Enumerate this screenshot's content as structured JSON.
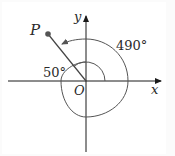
{
  "diagram": {
    "type": "angle-in-standard-position",
    "labels": {
      "point": "P",
      "y_axis": "y",
      "x_axis": "x",
      "origin": "O",
      "angle_large": "490°",
      "angle_small": "50°"
    },
    "angles": {
      "rotation_degrees": 490,
      "reference_angle_to_negative_x_degrees": 50,
      "terminal_side_degrees": 130
    },
    "colors": {
      "line": "#2a2a2a",
      "arc": "#555555",
      "point": "#555555",
      "border": "#eeeeee"
    }
  }
}
